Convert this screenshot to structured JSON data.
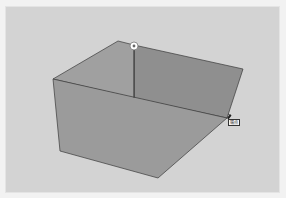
{
  "viewport": {
    "background": "#d3d3d3",
    "model": {
      "front_face_color": "#9a9a9a",
      "inner_face_color": "#8e8e8e",
      "left_face_color": "#a3a3a3",
      "edge_color": "#3a3a3a"
    },
    "inference": {
      "endpoint_marker": "endpoint-marker",
      "cursor_tooltip": "端点"
    }
  }
}
